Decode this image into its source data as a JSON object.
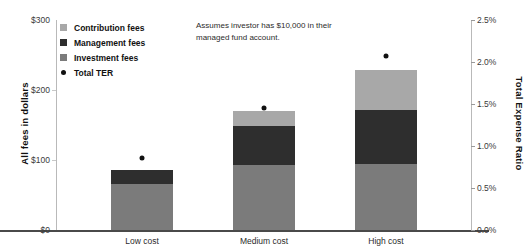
{
  "chart_data": {
    "type": "bar",
    "subtype": "stacked-bar-with-overlay-scatter",
    "title": "",
    "annotation": "Assumes investor has $10,000 in their managed fund account.",
    "categories": [
      "Low cost",
      "Medium cost",
      "High cost"
    ],
    "xlabel": "",
    "ylabel": "All fees in dollars",
    "y2label": "Total Expense Ratio",
    "ylim": [
      0,
      300
    ],
    "yticks": [
      "$0",
      "$100",
      "$200",
      "$300"
    ],
    "ytick_values": [
      0,
      100,
      200,
      300
    ],
    "y2lim": [
      0,
      2.5
    ],
    "y2ticks": [
      "0.0%",
      "0.5%",
      "1.0%",
      "1.5%",
      "2.0%",
      "2.5%"
    ],
    "y2tick_values": [
      0,
      0.5,
      1.0,
      1.5,
      2.0,
      2.5
    ],
    "grid": false,
    "legend_position": "upper-left-inside",
    "series": [
      {
        "name": "Investment fees",
        "color": "#7b7b7b",
        "axis": "left",
        "values": [
          66,
          93,
          95
        ]
      },
      {
        "name": "Management fees",
        "color": "#2e2e2e",
        "axis": "left",
        "values": [
          20,
          55,
          76
        ]
      },
      {
        "name": "Contribution fees",
        "color": "#a8a8a8",
        "axis": "left",
        "values": [
          0,
          22,
          58
        ]
      },
      {
        "name": "Total TER",
        "color": "#111111",
        "axis": "right",
        "marker": "dot",
        "values": [
          0.86,
          1.45,
          2.07
        ]
      }
    ],
    "totals": [
      86,
      170,
      229
    ]
  },
  "legend": {
    "items": [
      {
        "label": "Contribution fees",
        "swatch": "#a8a8a8",
        "shape": "square"
      },
      {
        "label": "Management fees",
        "swatch": "#2e2e2e",
        "shape": "square"
      },
      {
        "label": "Investment fees",
        "swatch": "#7b7b7b",
        "shape": "square"
      },
      {
        "label": "Total TER",
        "swatch": "#111111",
        "shape": "circle"
      }
    ]
  }
}
